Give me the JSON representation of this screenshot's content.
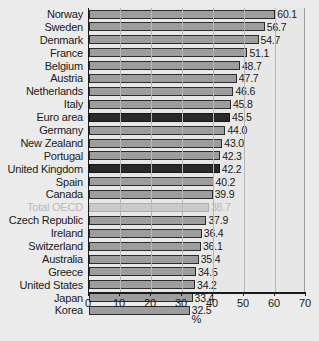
{
  "chart_data": {
    "type": "bar",
    "orientation": "horizontal",
    "title": "",
    "xlabel": "%",
    "ylabel": "",
    "xlim": [
      0,
      70
    ],
    "xticks": [
      0,
      10,
      20,
      30,
      40,
      50,
      60,
      70
    ],
    "grid": true,
    "legend": "none",
    "categories": [
      "Norway",
      "Sweden",
      "Denmark",
      "France",
      "Belgium",
      "Austria",
      "Netherlands",
      "Italy",
      "Euro area",
      "Germany",
      "New Zealand",
      "Portugal",
      "United Kingdom",
      "Spain",
      "Canada",
      "Total OECD",
      "Czech Republic",
      "Ireland",
      "Switzerland",
      "Australia",
      "Greece",
      "United States",
      "Japan",
      "Korea"
    ],
    "values": [
      60.1,
      56.7,
      54.7,
      51.1,
      48.7,
      47.7,
      46.6,
      45.8,
      45.5,
      44.0,
      43.0,
      42.3,
      42.2,
      40.2,
      39.9,
      38.7,
      37.9,
      36.4,
      36.1,
      35.4,
      34.5,
      34.2,
      33.4,
      32.5
    ],
    "value_labels": [
      "60.1",
      "56.7",
      "54.7",
      "51.1",
      "48.7",
      "47.7",
      "46.6",
      "45.8",
      "45.5",
      "44.0",
      "43.0",
      "42.3",
      "42.2",
      "40.2",
      "39.9",
      "38.7",
      "37.9",
      "36.4",
      "36.1",
      "35.4",
      "34.5",
      "34.2",
      "33.4",
      "32.5"
    ],
    "styles": [
      "normal",
      "normal",
      "normal",
      "normal",
      "normal",
      "normal",
      "normal",
      "normal",
      "dark",
      "normal",
      "normal",
      "normal",
      "dark",
      "normal",
      "normal",
      "light",
      "normal",
      "normal",
      "normal",
      "normal",
      "normal",
      "normal",
      "normal",
      "normal"
    ],
    "colors": {
      "bar": "#9d9d9d",
      "bar_dark": "#2a2a2a",
      "bar_light": "#c9c9c9",
      "plot_background": "#e7e7e7",
      "page_background": "#ebebeb",
      "axis": "#1a1a1a",
      "grid": "#b6b6b6",
      "text": "#1a1a1a",
      "muted_text": "#b9b9b9"
    }
  }
}
